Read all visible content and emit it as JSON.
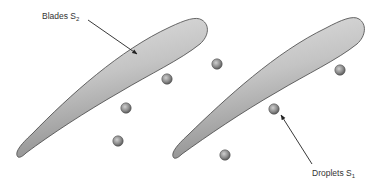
{
  "labels": {
    "blades": {
      "text": "Blades S",
      "sub": "2"
    },
    "droplets": {
      "text": "Droplets S",
      "sub": "1"
    }
  },
  "colors": {
    "blade_light": "#d9d9d9",
    "blade_dark": "#8a8a8a",
    "outline": "#444444",
    "droplet_light": "#bdbdbd",
    "droplet_dark": "#5a5a5a",
    "arrow": "#222222"
  },
  "droplets": [
    {
      "cx": 167,
      "cy": 79
    },
    {
      "cx": 126,
      "cy": 108
    },
    {
      "cx": 118,
      "cy": 141
    },
    {
      "cx": 217,
      "cy": 64
    },
    {
      "cx": 340,
      "cy": 70
    },
    {
      "cx": 274,
      "cy": 109
    },
    {
      "cx": 225,
      "cy": 155
    }
  ]
}
